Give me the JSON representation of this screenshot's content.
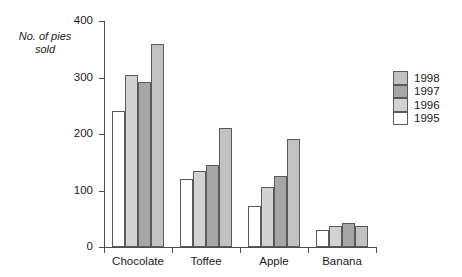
{
  "chart_data": {
    "type": "bar",
    "title": "",
    "subtitle": "",
    "xlabel": "",
    "ylabel": "No. of pies\nsold",
    "ylim": [
      0,
      400
    ],
    "yticks": [
      0,
      100,
      200,
      300,
      400
    ],
    "ytick_labels": [
      "0",
      "100",
      "200",
      "300",
      "400"
    ],
    "grid": false,
    "legend_position": "right",
    "categories": [
      "Chocolate",
      "Toffee",
      "Apple",
      "Banana"
    ],
    "series": [
      {
        "name": "1995",
        "color": "#ffffff",
        "values": [
          240,
          120,
          72,
          30
        ]
      },
      {
        "name": "1996",
        "color": "#d2d2d2",
        "values": [
          305,
          135,
          107,
          38
        ]
      },
      {
        "name": "1997",
        "color": "#a6a6a6",
        "values": [
          292,
          146,
          126,
          43
        ]
      },
      {
        "name": "1998",
        "color": "#c2c2c2",
        "values": [
          360,
          211,
          192,
          38
        ]
      }
    ],
    "legend_order": [
      "1998",
      "1997",
      "1996",
      "1995"
    ],
    "axis_color": "#4d4d4d",
    "bar_outline_color": "#5a5a5a",
    "background": "#ffffff"
  }
}
